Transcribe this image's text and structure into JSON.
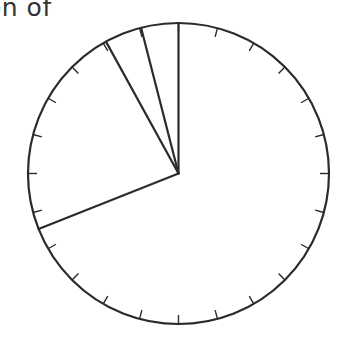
{
  "chart_data": {
    "type": "pie",
    "title": "on of",
    "title_note": "title is cropped at the left edge; only the visible fragment is shown",
    "slices": [
      {
        "label": "",
        "value": 69,
        "start_deg": 0,
        "end_deg": 248
      },
      {
        "label": "",
        "value": 23,
        "start_deg": 248,
        "end_deg": 330
      },
      {
        "label": "",
        "value": 4,
        "start_deg": 330,
        "end_deg": 345
      },
      {
        "label": "",
        "value": 4,
        "start_deg": 345,
        "end_deg": 360
      }
    ],
    "values": [
      69,
      23,
      4,
      4
    ],
    "start_angle": "12 o'clock",
    "direction": "clockwise",
    "tick_marks": 24,
    "tick_interval_deg": 15,
    "fill": "none",
    "legend": "none"
  },
  "style": {
    "stroke_color": "#2b2b2b",
    "title_color": "#333333",
    "background": "#ffffff"
  },
  "geometry": {
    "cx": 178.5,
    "cy": 173.5,
    "r": 150.5
  }
}
